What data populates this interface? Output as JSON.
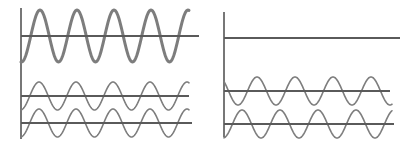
{
  "diagram": {
    "colors": {
      "axis": "#555555",
      "baseline": "#5a5a5a",
      "wave": "#7d7d7d",
      "background": "#ffffff"
    },
    "panels": [
      {
        "id": "left",
        "axis": {
          "x": 21,
          "y_top": 8,
          "y_bottom": 139
        },
        "signals": [
          {
            "name": "large-amplitude-wave",
            "baseline_y": 36,
            "baseline_x_end": 199,
            "x_start": 21,
            "x_end": 189,
            "amplitude": 26,
            "period": 37,
            "phase_peak_x": 40,
            "thickness": "thick"
          },
          {
            "name": "small-wave-a",
            "baseline_y": 96,
            "baseline_x_end": 189,
            "x_start": 21,
            "x_end": 189,
            "amplitude": 14,
            "period": 37,
            "phase_peak_x": 39,
            "thickness": "thin"
          },
          {
            "name": "small-wave-b",
            "baseline_y": 123,
            "baseline_x_end": 192,
            "x_start": 21,
            "x_end": 189,
            "amplitude": 14,
            "period": 37,
            "phase_peak_x": 39,
            "thickness": "thin"
          }
        ]
      },
      {
        "id": "right",
        "axis": {
          "x": 224,
          "y_top": 12,
          "y_bottom": 137
        },
        "signals": [
          {
            "name": "flat-line",
            "baseline_y": 38,
            "baseline_x_end": 400,
            "x_start": 224,
            "x_end": 224,
            "amplitude": 0,
            "period": 38,
            "phase_peak_x": 0,
            "thickness": "none"
          },
          {
            "name": "small-wave-c",
            "baseline_y": 91,
            "baseline_x_end": 390,
            "x_start": 224,
            "x_end": 392,
            "amplitude": 14,
            "period": 38,
            "phase_peak_x": 257,
            "thickness": "thin"
          },
          {
            "name": "small-wave-d",
            "baseline_y": 124,
            "baseline_x_end": 394,
            "x_start": 224,
            "x_end": 392,
            "amplitude": 14,
            "period": 38,
            "phase_peak_x": 242,
            "thickness": "thin"
          }
        ]
      }
    ]
  }
}
